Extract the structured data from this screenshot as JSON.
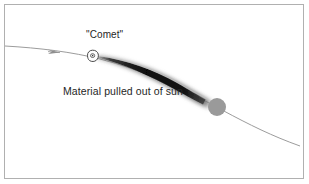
{
  "figure": {
    "title_text": "",
    "background_color": "#ffffff",
    "frame_color": "#b0b0b0",
    "labels": {
      "comet": "\"Comet\"",
      "material": "Material pulled out of sun"
    },
    "objects": {
      "comet_nucleus": {
        "name": "comet-nucleus",
        "outline_color": "#4a4a4a",
        "fill_color": "#fdfdfd"
      },
      "sun": {
        "name": "sun-disc",
        "fill_color": "#9a9a9a",
        "radius_px": 9
      },
      "tail": {
        "name": "comet-tail",
        "core_color": "#0d0d0d",
        "halo_color": "#b9b9b9",
        "description": "Material pulled out of sun"
      },
      "orbit": {
        "name": "orbit-path",
        "stroke_color": "#9c9c9c",
        "direction_arrow": "left"
      }
    }
  }
}
